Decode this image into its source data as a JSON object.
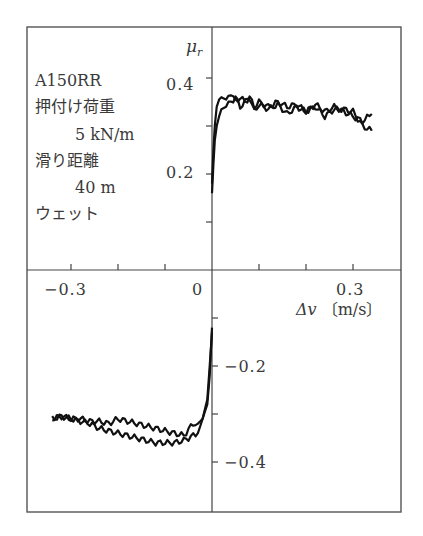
{
  "chart_data": {
    "type": "line",
    "title": "",
    "xlabel": "Δv 〔m/s〕",
    "ylabel": "μr",
    "xlim": [
      -0.4,
      0.4
    ],
    "ylim": [
      -0.5,
      0.5
    ],
    "x_ticks": [
      -0.3,
      -0.2,
      -0.1,
      0.1,
      0.2,
      0.3
    ],
    "x_tick_labels": [
      "-0.3",
      "0",
      "0.3"
    ],
    "y_ticks": [
      -0.4,
      -0.3,
      -0.2,
      -0.1,
      0.1,
      0.2,
      0.3,
      0.4
    ],
    "y_tick_labels": [
      "0.4",
      "0.2",
      "-0.2",
      "-0.4"
    ],
    "grid": false,
    "legend": null,
    "annotation": [
      "A150RR",
      "押付け荷重",
      "5 kN/m",
      "滑り距離",
      "40 m",
      "ウェット"
    ],
    "series": [
      {
        "name": "positive slip, curve A",
        "x": [
          0.0,
          0.003,
          0.006,
          0.01,
          0.015,
          0.02,
          0.03,
          0.04,
          0.05,
          0.06,
          0.07,
          0.08,
          0.09,
          0.1,
          0.12,
          0.14,
          0.16,
          0.18,
          0.2,
          0.22,
          0.24,
          0.26,
          0.28,
          0.3,
          0.32,
          0.34
        ],
        "y": [
          0.18,
          0.25,
          0.3,
          0.34,
          0.355,
          0.36,
          0.355,
          0.37,
          0.35,
          0.36,
          0.35,
          0.36,
          0.34,
          0.35,
          0.34,
          0.35,
          0.34,
          0.345,
          0.33,
          0.345,
          0.33,
          0.34,
          0.33,
          0.32,
          0.31,
          0.325
        ]
      },
      {
        "name": "positive slip, curve B",
        "x": [
          0.0,
          0.003,
          0.006,
          0.01,
          0.015,
          0.02,
          0.03,
          0.04,
          0.05,
          0.06,
          0.07,
          0.08,
          0.09,
          0.1,
          0.12,
          0.14,
          0.16,
          0.18,
          0.2,
          0.22,
          0.24,
          0.26,
          0.28,
          0.3,
          0.32,
          0.34
        ],
        "y": [
          0.16,
          0.22,
          0.27,
          0.3,
          0.32,
          0.335,
          0.34,
          0.35,
          0.36,
          0.34,
          0.35,
          0.36,
          0.33,
          0.345,
          0.335,
          0.345,
          0.325,
          0.34,
          0.33,
          0.34,
          0.32,
          0.335,
          0.335,
          0.33,
          0.3,
          0.29
        ]
      },
      {
        "name": "negative slip, curve A",
        "x": [
          -0.34,
          -0.32,
          -0.3,
          -0.28,
          -0.26,
          -0.24,
          -0.22,
          -0.2,
          -0.18,
          -0.16,
          -0.14,
          -0.12,
          -0.1,
          -0.08,
          -0.06,
          -0.04,
          -0.03,
          -0.02,
          -0.01,
          -0.005,
          0.0
        ],
        "y": [
          -0.31,
          -0.305,
          -0.31,
          -0.31,
          -0.315,
          -0.315,
          -0.32,
          -0.31,
          -0.315,
          -0.32,
          -0.325,
          -0.33,
          -0.335,
          -0.34,
          -0.345,
          -0.32,
          -0.32,
          -0.31,
          -0.28,
          -0.22,
          -0.12
        ]
      },
      {
        "name": "negative slip, curve B",
        "x": [
          -0.34,
          -0.32,
          -0.3,
          -0.28,
          -0.26,
          -0.24,
          -0.22,
          -0.2,
          -0.18,
          -0.16,
          -0.14,
          -0.12,
          -0.1,
          -0.08,
          -0.06,
          -0.04,
          -0.03,
          -0.02,
          -0.01,
          -0.005,
          0.0
        ],
        "y": [
          -0.31,
          -0.305,
          -0.31,
          -0.315,
          -0.32,
          -0.33,
          -0.335,
          -0.34,
          -0.345,
          -0.35,
          -0.355,
          -0.36,
          -0.36,
          -0.36,
          -0.355,
          -0.345,
          -0.34,
          -0.31,
          -0.27,
          -0.2,
          -0.13
        ]
      }
    ]
  },
  "labels": {
    "y_axis": "μ",
    "y_axis_sub": "r",
    "x_axis_delta": "Δv",
    "x_axis_unit": "〔m/s〕",
    "tick_y_04": "0.4",
    "tick_y_02": "0.2",
    "tick_y_m02": "−0.2",
    "tick_y_m04": "−0.4",
    "tick_x_m03": "−0.3",
    "tick_x_0": "0",
    "tick_x_03": "0.3",
    "annotation_lines": [
      "A150RR",
      "押付け荷重",
      "5 kN/m",
      "滑り距離",
      "40 m",
      "ウェット"
    ]
  }
}
